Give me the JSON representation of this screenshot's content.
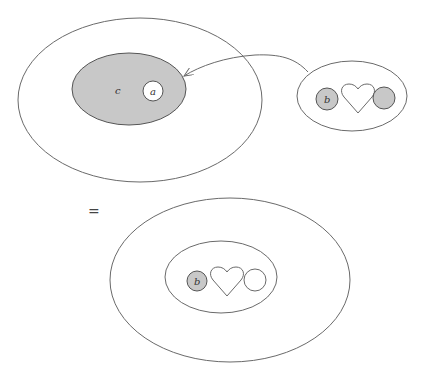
{
  "diagram": {
    "top": {
      "outer_ellipse": {
        "cx": 140,
        "cy": 100,
        "rx": 122,
        "ry": 82
      },
      "gray_ellipse": {
        "cx": 129,
        "cy": 89,
        "rx": 57,
        "ry": 36,
        "fill": "#c8c8c8",
        "label": "c"
      },
      "circle_a": {
        "cx": 153,
        "cy": 91,
        "r": 10,
        "fill": "#ffffff",
        "label": "a"
      },
      "right_ellipse": {
        "cx": 352,
        "cy": 96,
        "rx": 55,
        "ry": 35
      },
      "circle_b": {
        "cx": 327,
        "cy": 99,
        "r": 11,
        "fill": "#c8c8c8",
        "label": "b"
      },
      "heart": {
        "cx": 358,
        "cy": 98
      },
      "gray_circle": {
        "cx": 384,
        "cy": 98,
        "r": 11,
        "fill": "#c8c8c8"
      },
      "arrow": {
        "from": "right-ellipse",
        "to": "gray-ellipse"
      }
    },
    "equals_sign": "=",
    "bottom": {
      "outer_ellipse": {
        "cx": 230,
        "cy": 280,
        "rx": 120,
        "ry": 82
      },
      "inner_ellipse": {
        "cx": 221,
        "cy": 277,
        "rx": 56,
        "ry": 36
      },
      "circle_b": {
        "cx": 197,
        "cy": 281,
        "r": 10,
        "fill": "#c8c8c8",
        "label": "b"
      },
      "heart": {
        "cx": 227,
        "cy": 280
      },
      "white_circle": {
        "cx": 255,
        "cy": 280,
        "r": 11,
        "fill": "#ffffff"
      }
    }
  }
}
